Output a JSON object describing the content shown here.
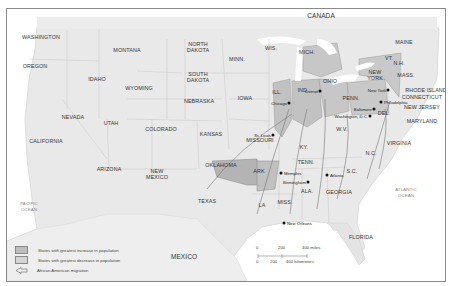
{
  "map": {
    "title_regions": {
      "country_labels": [
        "CANADA",
        "MEXICO"
      ],
      "ocean_labels": [
        "PACIFIC\nOCEAN",
        "ATLANTIC\nOCEAN"
      ]
    },
    "colors": {
      "ocean": "#ffffff",
      "land_neutral": "#e8e8e8",
      "increase": "#bdbdbd",
      "decrease": "#a6a6a6",
      "border": "#8a8a8a"
    },
    "states": [
      {
        "name": "WASHINGTON",
        "x": 40,
        "y": 36
      },
      {
        "name": "OREGON",
        "x": 34,
        "y": 65
      },
      {
        "name": "IDAHO",
        "x": 96,
        "y": 78
      },
      {
        "name": "MONTANA",
        "x": 126,
        "y": 49
      },
      {
        "name": "WYOMING",
        "x": 138,
        "y": 87
      },
      {
        "name": "NORTH\nDAKOTA",
        "x": 197,
        "y": 46
      },
      {
        "name": "SOUTH\nDAKOTA",
        "x": 197,
        "y": 76
      },
      {
        "name": "MINN.",
        "x": 236,
        "y": 58
      },
      {
        "name": "NEBRASKA",
        "x": 198,
        "y": 100
      },
      {
        "name": "IOWA",
        "x": 244,
        "y": 97
      },
      {
        "name": "NEVADA",
        "x": 72,
        "y": 116
      },
      {
        "name": "UTAH",
        "x": 110,
        "y": 122
      },
      {
        "name": "COLORADO",
        "x": 160,
        "y": 128
      },
      {
        "name": "KANSAS",
        "x": 210,
        "y": 133
      },
      {
        "name": "CALIFORNIA",
        "x": 45,
        "y": 140
      },
      {
        "name": "ARIZONA",
        "x": 108,
        "y": 168
      },
      {
        "name": "NEW\nMEXICO",
        "x": 156,
        "y": 173
      },
      {
        "name": "OKLAHOMA",
        "x": 220,
        "y": 164
      },
      {
        "name": "TEXAS",
        "x": 206,
        "y": 200
      },
      {
        "name": "WIS.",
        "x": 270,
        "y": 47
      },
      {
        "name": "MICH.",
        "x": 306,
        "y": 51
      },
      {
        "name": "ILL.",
        "x": 276,
        "y": 91
      },
      {
        "name": "IND.",
        "x": 302,
        "y": 89
      },
      {
        "name": "OHIO",
        "x": 329,
        "y": 80
      },
      {
        "name": "MISSOURI",
        "x": 259,
        "y": 139
      },
      {
        "name": "KY.",
        "x": 303,
        "y": 146
      },
      {
        "name": "TENN.",
        "x": 305,
        "y": 161
      },
      {
        "name": "ARK",
        "x": 258,
        "y": 170
      },
      {
        "name": "MISS.",
        "x": 284,
        "y": 201
      },
      {
        "name": "ALA.",
        "x": 306,
        "y": 190
      },
      {
        "name": "GEORGIA",
        "x": 338,
        "y": 191
      },
      {
        "name": "LA",
        "x": 261,
        "y": 204
      },
      {
        "name": "S.C.",
        "x": 351,
        "y": 170
      },
      {
        "name": "N.C.",
        "x": 370,
        "y": 152
      },
      {
        "name": "VIRGINIA",
        "x": 398,
        "y": 142
      },
      {
        "name": "W.V.",
        "x": 341,
        "y": 128
      },
      {
        "name": "PENN.",
        "x": 350,
        "y": 97
      },
      {
        "name": "NEW\nYORK",
        "x": 374,
        "y": 74
      },
      {
        "name": "MAINE",
        "x": 403,
        "y": 41
      },
      {
        "name": "VT.",
        "x": 388,
        "y": 57
      },
      {
        "name": "N.H.",
        "x": 398,
        "y": 62
      },
      {
        "name": "MASS.",
        "x": 405,
        "y": 74
      },
      {
        "name": "RHODE ISLAND",
        "x": 425,
        "y": 89
      },
      {
        "name": "CONNECTICUT",
        "x": 421,
        "y": 96
      },
      {
        "name": "NEW JERSEY",
        "x": 421,
        "y": 106
      },
      {
        "name": "DEL.",
        "x": 383,
        "y": 112
      },
      {
        "name": "MARYLAND",
        "x": 421,
        "y": 120
      },
      {
        "name": "FLORIDA",
        "x": 360,
        "y": 236
      }
    ],
    "cities": [
      {
        "name": "Chicago",
        "x": 288,
        "y": 102
      },
      {
        "name": "Detroit",
        "x": 319,
        "y": 90
      },
      {
        "name": "St. Louis",
        "x": 272,
        "y": 134
      },
      {
        "name": "Memphis",
        "x": 280,
        "y": 172
      },
      {
        "name": "Birmingham",
        "x": 307,
        "y": 181
      },
      {
        "name": "Atlanta",
        "x": 326,
        "y": 174
      },
      {
        "name": "New Orleans",
        "x": 283,
        "y": 222
      },
      {
        "name": "New York",
        "x": 387,
        "y": 89
      },
      {
        "name": "Philadelphia",
        "x": 380,
        "y": 101
      },
      {
        "name": "Baltimore",
        "x": 373,
        "y": 108
      },
      {
        "name": "Washington, D.C.",
        "x": 369,
        "y": 115
      }
    ],
    "shaded_increase": [
      "ILL.",
      "IND.",
      "OHIO",
      "MICH.",
      "PENN.",
      "NEW YORK"
    ],
    "shaded_decrease": [
      "OKLAHOMA",
      "ARK"
    ]
  },
  "legend": {
    "items": [
      {
        "label": "States with greatest increase in population",
        "swatch": "#bdbdbd"
      },
      {
        "label": "States with greatest decrease in population",
        "swatch": "#d4d4d4"
      },
      {
        "label": "African American migration",
        "swatch": "arrow"
      }
    ]
  },
  "scale": {
    "miles_ticks": [
      "0",
      "200",
      "400 miles"
    ],
    "km_ticks": [
      "0",
      "200",
      "400 kilometers"
    ]
  }
}
